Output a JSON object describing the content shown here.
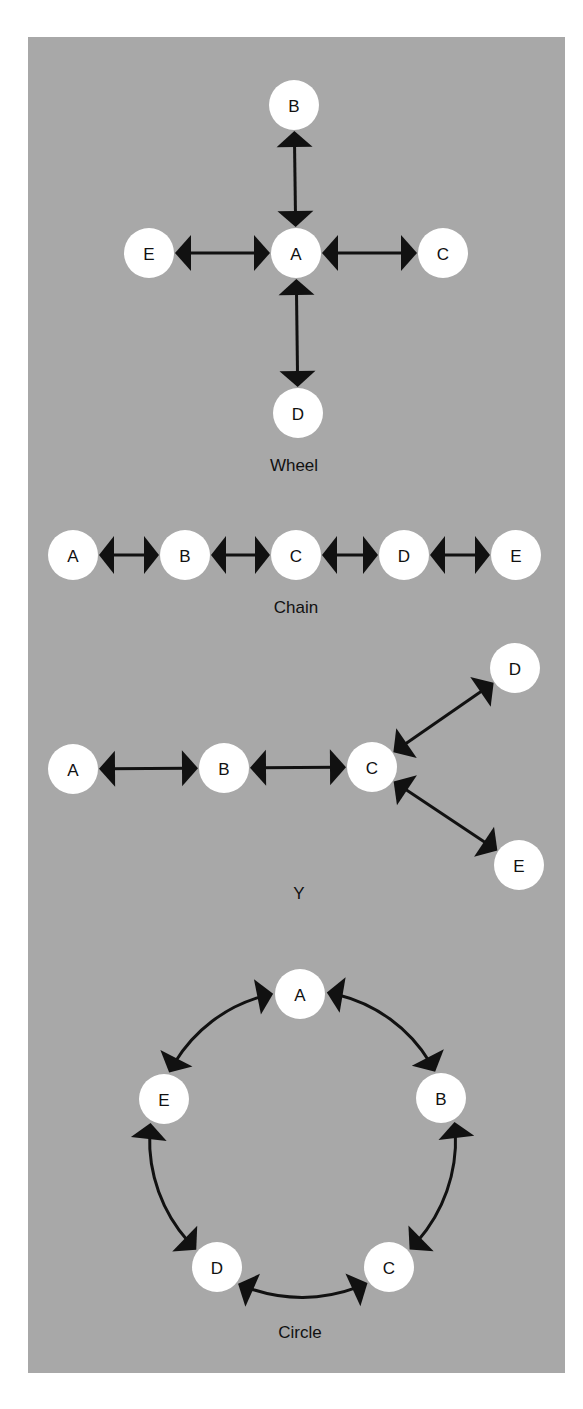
{
  "figure": {
    "background_color": "#a8a8a8",
    "node_color": "#ffffff",
    "edge_color": "#111111",
    "node_radius": 25
  },
  "networks": [
    {
      "id": "wheel",
      "caption": "Wheel",
      "caption_pos": [
        294,
        465
      ],
      "nodes": [
        {
          "label": "A",
          "x": 296,
          "y": 253
        },
        {
          "label": "B",
          "x": 294,
          "y": 105
        },
        {
          "label": "C",
          "x": 443,
          "y": 253
        },
        {
          "label": "D",
          "x": 298,
          "y": 413
        },
        {
          "label": "E",
          "x": 149,
          "y": 253
        }
      ],
      "edges": [
        {
          "from": "A",
          "to": "B",
          "curve": 0
        },
        {
          "from": "A",
          "to": "C",
          "curve": 0
        },
        {
          "from": "A",
          "to": "D",
          "curve": 0
        },
        {
          "from": "A",
          "to": "E",
          "curve": 0
        }
      ]
    },
    {
      "id": "chain",
      "caption": "Chain",
      "caption_pos": [
        296,
        607
      ],
      "nodes": [
        {
          "label": "A",
          "x": 73,
          "y": 555
        },
        {
          "label": "B",
          "x": 185,
          "y": 555
        },
        {
          "label": "C",
          "x": 296,
          "y": 555
        },
        {
          "label": "D",
          "x": 404,
          "y": 555
        },
        {
          "label": "E",
          "x": 516,
          "y": 555
        }
      ],
      "edges": [
        {
          "from": "A",
          "to": "B",
          "curve": 0
        },
        {
          "from": "B",
          "to": "C",
          "curve": 0
        },
        {
          "from": "C",
          "to": "D",
          "curve": 0
        },
        {
          "from": "D",
          "to": "E",
          "curve": 0
        }
      ]
    },
    {
      "id": "y",
      "caption": "Y",
      "caption_pos": [
        299,
        893
      ],
      "nodes": [
        {
          "label": "A",
          "x": 73,
          "y": 769
        },
        {
          "label": "B",
          "x": 224,
          "y": 768
        },
        {
          "label": "C",
          "x": 372,
          "y": 767
        },
        {
          "label": "D",
          "x": 515,
          "y": 668
        },
        {
          "label": "E",
          "x": 519,
          "y": 865
        }
      ],
      "edges": [
        {
          "from": "A",
          "to": "B",
          "curve": 0
        },
        {
          "from": "B",
          "to": "C",
          "curve": 0
        },
        {
          "from": "C",
          "to": "D",
          "curve": 0
        },
        {
          "from": "C",
          "to": "E",
          "curve": 0
        }
      ]
    },
    {
      "id": "circle",
      "caption": "Circle",
      "caption_pos": [
        300,
        1332
      ],
      "nodes": [
        {
          "label": "A",
          "x": 300,
          "y": 994
        },
        {
          "label": "B",
          "x": 441,
          "y": 1098
        },
        {
          "label": "C",
          "x": 389,
          "y": 1267
        },
        {
          "label": "D",
          "x": 217,
          "y": 1267
        },
        {
          "label": "E",
          "x": 164,
          "y": 1099
        }
      ],
      "edges": [
        {
          "from": "A",
          "to": "B",
          "curve": 1
        },
        {
          "from": "B",
          "to": "C",
          "curve": 1
        },
        {
          "from": "C",
          "to": "D",
          "curve": 1
        },
        {
          "from": "D",
          "to": "E",
          "curve": 1
        },
        {
          "from": "E",
          "to": "A",
          "curve": 1
        }
      ],
      "circle_center": [
        302,
        1140
      ]
    }
  ]
}
